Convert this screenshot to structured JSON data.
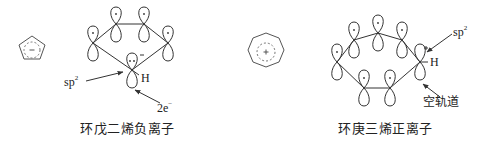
{
  "diagram": {
    "left": {
      "name": "cyclopentadienyl-anion",
      "caption": "环戊二烯负离子",
      "ring_size": 5,
      "center_symbol": "−",
      "labels": {
        "hybrid": "sp",
        "hybrid_sup": "2",
        "hydrogen": "H",
        "electrons": "2e",
        "electrons_sup": "−",
        "orbital_charge": "−",
        "lone_pair": "··"
      }
    },
    "right": {
      "name": "cycloheptatrienyl-cation",
      "caption": "环庚三烯正离子",
      "ring_size": 7,
      "center_symbol": "+",
      "labels": {
        "hybrid": "sp",
        "hybrid_sup": "2",
        "hydrogen": "H",
        "empty_orbital": "空轨道",
        "orbital_charge": "+"
      }
    },
    "colors": {
      "line": "#333333",
      "dashed": "#666666",
      "background": "#ffffff"
    }
  }
}
